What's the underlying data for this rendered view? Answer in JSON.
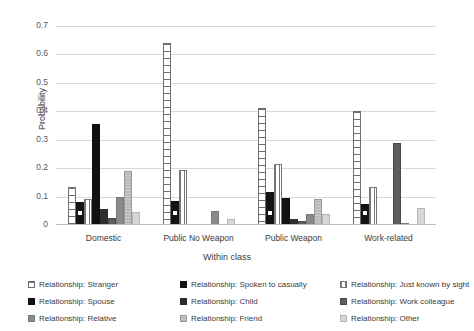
{
  "chart_data": {
    "type": "bar",
    "title": "",
    "xlabel": "Within class",
    "ylabel": "Probability",
    "ylim": [
      0,
      0.7
    ],
    "yticks": [
      "0",
      "0.1",
      "0.2",
      "0.3",
      "0.4",
      "0.5",
      "0.6",
      "0.7"
    ],
    "grid": true,
    "legend_position": "bottom",
    "categories": [
      "Domestic",
      "Public No Weapon",
      "Public Weapon",
      "Work-related"
    ],
    "series": [
      {
        "name": "Relationship: Stranger",
        "pattern": "p-stranger",
        "values": [
          0.135,
          0.64,
          0.41,
          0.4
        ]
      },
      {
        "name": "Relationship: Spoken to casually",
        "pattern": "p-spoken",
        "values": [
          0.08,
          0.085,
          0.115,
          0.075
        ]
      },
      {
        "name": "Relationship: Just known by sight",
        "pattern": "p-sight",
        "values": [
          0.09,
          0.195,
          0.215,
          0.135
        ]
      },
      {
        "name": "Relationship: Spouse",
        "pattern": "p-spouse",
        "values": [
          0.355,
          0.0,
          0.095,
          0.0
        ]
      },
      {
        "name": "Relationship: Child",
        "pattern": "p-child",
        "values": [
          0.055,
          0.0,
          0.02,
          0.0
        ]
      },
      {
        "name": "Relationship: Work colleague",
        "pattern": "p-colleague",
        "values": [
          0.025,
          0.0,
          0.015,
          0.29
        ]
      },
      {
        "name": "Relationship: Relative",
        "pattern": "p-relative",
        "values": [
          0.1,
          0.05,
          0.04,
          0.005
        ]
      },
      {
        "name": "Relationship: Friend",
        "pattern": "p-friend",
        "values": [
          0.19,
          0.0,
          0.09,
          0.0
        ]
      },
      {
        "name": "Relationship: Other",
        "pattern": "p-other",
        "values": [
          0.045,
          0.02,
          0.04,
          0.06
        ]
      }
    ]
  },
  "legend": {
    "items": [
      {
        "label": "Relationship: Stranger",
        "pattern": "p-stranger"
      },
      {
        "label": "Relationship: Spoken to casually",
        "pattern": "p-spoken"
      },
      {
        "label": "Relationship: Just known by sight",
        "pattern": "p-sight"
      },
      {
        "label": "Relationship: Spouse",
        "pattern": "p-spouse"
      },
      {
        "label": "Relationship: Child",
        "pattern": "p-child"
      },
      {
        "label": "Relationship: Work colleague",
        "pattern": "p-colleague"
      },
      {
        "label": "Relationship: Relative",
        "pattern": "p-relative"
      },
      {
        "label": "Relationship: Friend",
        "pattern": "p-friend"
      },
      {
        "label": "Relationship: Other",
        "pattern": "p-other"
      }
    ]
  },
  "colors": {
    "gridline": "#d9d9d9",
    "text": "#3b3b3b",
    "tick_text": "#595959",
    "background": "#ffffff"
  }
}
